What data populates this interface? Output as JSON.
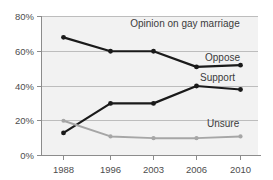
{
  "chart_data": {
    "type": "line",
    "title": "Opinion on gay marriage",
    "xlabel": "",
    "ylabel": "",
    "categories": [
      "1988",
      "1996",
      "2003",
      "2006",
      "2010"
    ],
    "x": [
      1988,
      1996,
      2003,
      2006,
      2010
    ],
    "ylim": [
      0,
      80
    ],
    "ytick_values": [
      0,
      20,
      40,
      60,
      80
    ],
    "ytick_labels": [
      "0%",
      "20%",
      "40%",
      "60%",
      "80%"
    ],
    "grid": true,
    "legend_position": "inline-right",
    "series": [
      {
        "name": "Oppose",
        "color": "#1a1a1a",
        "values": [
          68,
          60,
          60,
          51,
          52
        ],
        "label": "Oppose"
      },
      {
        "name": "Support",
        "color": "#1a1a1a",
        "values": [
          13,
          30,
          30,
          40,
          38
        ],
        "label": "Support"
      },
      {
        "name": "Unsure",
        "color": "#a6a6a6",
        "values": [
          20,
          11,
          10,
          10,
          11
        ],
        "label": "Unsure"
      }
    ]
  },
  "labels": {
    "title": "Opinion on gay marriage",
    "oppose": "Oppose",
    "support": "Support",
    "unsure": "Unsure",
    "y0": "0%",
    "y20": "20%",
    "y40": "40%",
    "y60": "60%",
    "y80": "80%",
    "x1988": "1988",
    "x1996": "1996",
    "x2003": "2003",
    "x2006": "2006",
    "x2010": "2010"
  },
  "colors": {
    "dark_series": "#1a1a1a",
    "light_series": "#a6a6a6",
    "plot_background": "#f2f2f2",
    "gridline": "#bdbdbd",
    "axis": "#8c8c8c",
    "text": "#3b3b3b"
  }
}
